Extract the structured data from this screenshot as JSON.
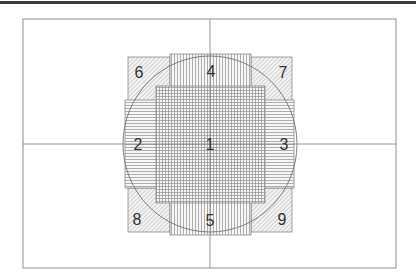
{
  "diagram": {
    "title": "",
    "colors": {
      "stroke": "#8a8a8a",
      "frame": "#8f8f8f",
      "text": "#333333",
      "top_bar": "#3a3a3a"
    },
    "regions": [
      {
        "id": "1",
        "label": "1",
        "pattern": "grid"
      },
      {
        "id": "2",
        "label": "2",
        "pattern": "horizontal-lines"
      },
      {
        "id": "3",
        "label": "3",
        "pattern": "horizontal-lines"
      },
      {
        "id": "4",
        "label": "4",
        "pattern": "vertical-lines"
      },
      {
        "id": "5",
        "label": "5",
        "pattern": "vertical-lines"
      },
      {
        "id": "6",
        "label": "6",
        "pattern": "diagonal-lines"
      },
      {
        "id": "7",
        "label": "7",
        "pattern": "diagonal-lines"
      },
      {
        "id": "8",
        "label": "8",
        "pattern": "diagonal-lines"
      },
      {
        "id": "9",
        "label": "9",
        "pattern": "diagonal-lines"
      }
    ],
    "overlay": "circle",
    "crosshair": "vertical and horizontal center lines"
  }
}
